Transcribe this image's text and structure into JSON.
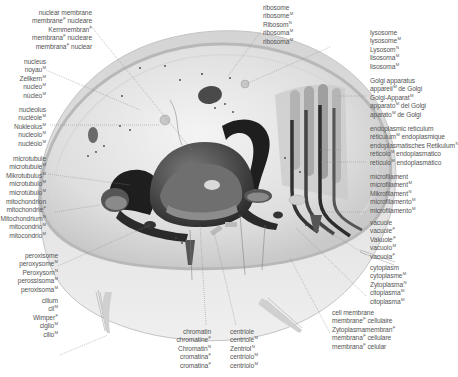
{
  "diagram": {
    "colors": {
      "label_text": "#555555",
      "leader_line": "#8a8a8a",
      "cell_fill": "#e6e6e6",
      "membrane": "#bdbdbd",
      "dark_organelle": "#2a2a2a"
    }
  },
  "labels": {
    "nuclear_membrane": {
      "lines": [
        {
          "t": "nuclear membrane",
          "g": ""
        },
        {
          "t": "membrane",
          "g": "F",
          "s": " nucleare"
        },
        {
          "t": "Kernmembran",
          "g": "F"
        },
        {
          "t": "membrana",
          "g": "F",
          "s": " nucleare"
        },
        {
          "t": "membrana",
          "g": "F",
          "s": " nuclear"
        }
      ]
    },
    "nucleus": {
      "lines": [
        {
          "t": "nucleus",
          "g": ""
        },
        {
          "t": "noyau",
          "g": "M"
        },
        {
          "t": "Zellkern",
          "g": "M"
        },
        {
          "t": "nucleo",
          "g": "M"
        },
        {
          "t": "núcleo",
          "g": "M"
        }
      ]
    },
    "nucleolus": {
      "lines": [
        {
          "t": "nucleolus",
          "g": ""
        },
        {
          "t": "nucléole",
          "g": "M"
        },
        {
          "t": "Nukleolus",
          "g": "M"
        },
        {
          "t": "nucleolo",
          "g": "M"
        },
        {
          "t": "nucléolo",
          "g": "M"
        }
      ]
    },
    "microtubule": {
      "lines": [
        {
          "t": "microtubule",
          "g": ""
        },
        {
          "t": "microtubule",
          "g": "M"
        },
        {
          "t": "Mikrotubulus",
          "g": "M"
        },
        {
          "t": "microtubulo",
          "g": "M"
        },
        {
          "t": "microtúbulo",
          "g": "M"
        }
      ]
    },
    "mitochondrion": {
      "lines": [
        {
          "t": "mitochondrion",
          "g": ""
        },
        {
          "t": "mitochondrie",
          "g": "F"
        },
        {
          "t": "Mitochondrium",
          "g": "N"
        },
        {
          "t": "mitocondrio",
          "g": "M"
        },
        {
          "t": "mitocondrio",
          "g": "M"
        }
      ]
    },
    "peroxisome": {
      "lines": [
        {
          "t": "peroxisome",
          "g": ""
        },
        {
          "t": "peroxysome",
          "g": "M"
        },
        {
          "t": "Peroxysom",
          "g": "N"
        },
        {
          "t": "perossisoma",
          "g": "M"
        },
        {
          "t": "peroxisoma",
          "g": "M"
        }
      ]
    },
    "cilium": {
      "lines": [
        {
          "t": "cilium",
          "g": ""
        },
        {
          "t": "cil",
          "g": "M"
        },
        {
          "t": "Wimper",
          "g": "F"
        },
        {
          "t": "ciglio",
          "g": "M"
        },
        {
          "t": "cilio",
          "g": "M"
        }
      ]
    },
    "ribosome": {
      "lines": [
        {
          "t": "ribosome",
          "g": ""
        },
        {
          "t": "ribosome",
          "g": "M"
        },
        {
          "t": "Ribosom",
          "g": "N"
        },
        {
          "t": "ribosoma",
          "g": "M"
        },
        {
          "t": "ribosoma",
          "g": "M"
        }
      ]
    },
    "lysosome": {
      "lines": [
        {
          "t": "lysosome",
          "g": ""
        },
        {
          "t": "lysosome",
          "g": "M"
        },
        {
          "t": "Lysosom",
          "g": "N"
        },
        {
          "t": "lisosoma",
          "g": "M"
        },
        {
          "t": "lisosoma",
          "g": "M"
        }
      ]
    },
    "golgi": {
      "lines": [
        {
          "t": "Golgi apparatus",
          "g": ""
        },
        {
          "t": "appareil",
          "g": "M",
          "s": " de Golgi"
        },
        {
          "t": "Golgi-Apparat",
          "g": "M"
        },
        {
          "t": "apparato",
          "g": "M",
          "s": " del Golgi"
        },
        {
          "t": "aparato",
          "g": "M",
          "s": " de Golgi"
        }
      ]
    },
    "endoplasmic_reticulum": {
      "lines": [
        {
          "t": "endoplasmic reticulum",
          "g": ""
        },
        {
          "t": "réticulum",
          "g": "M",
          "s": " endoplasmique"
        },
        {
          "t": "endoplasmatisches Retikulum",
          "g": "N"
        },
        {
          "t": "reticolo",
          "g": "M",
          "s": " endoplasmatico"
        },
        {
          "t": "retículo",
          "g": "M",
          "s": " endoplasmático"
        }
      ]
    },
    "microfilament": {
      "lines": [
        {
          "t": "microfilament",
          "g": ""
        },
        {
          "t": "microfilament",
          "g": "M"
        },
        {
          "t": "Mikrofilament",
          "g": "N"
        },
        {
          "t": "microfilamento",
          "g": "M"
        },
        {
          "t": "microfilamento",
          "g": "M"
        }
      ]
    },
    "vacuole": {
      "lines": [
        {
          "t": "vacuole",
          "g": ""
        },
        {
          "t": "vacuole",
          "g": "F"
        },
        {
          "t": "Vakuole",
          "g": "F"
        },
        {
          "t": "vacuolo",
          "g": "M"
        },
        {
          "t": "vacuola",
          "g": "F"
        }
      ]
    },
    "cytoplasm": {
      "lines": [
        {
          "t": "cytoplasm",
          "g": ""
        },
        {
          "t": "cytoplasme",
          "g": "M"
        },
        {
          "t": "Zytoplasma",
          "g": "N"
        },
        {
          "t": "citoplasma",
          "g": "M"
        },
        {
          "t": "citoplasma",
          "g": "M"
        }
      ]
    },
    "cell_membrane": {
      "lines": [
        {
          "t": "cell membrane",
          "g": ""
        },
        {
          "t": "membrane",
          "g": "F",
          "s": " cellulaire"
        },
        {
          "t": "Zytoplasmamembran",
          "g": "F"
        },
        {
          "t": "membrana",
          "g": "F",
          "s": " cellulare"
        },
        {
          "t": "membrana",
          "g": "F",
          "s": " celular"
        }
      ]
    },
    "chromatin": {
      "lines": [
        {
          "t": "chromatin",
          "g": ""
        },
        {
          "t": "chromatine",
          "g": "F"
        },
        {
          "t": "Chromatin",
          "g": "N"
        },
        {
          "t": "cromatina",
          "g": "F"
        },
        {
          "t": "cromatina",
          "g": "F"
        }
      ]
    },
    "centriole": {
      "lines": [
        {
          "t": "centriole",
          "g": ""
        },
        {
          "t": "centriole",
          "g": "M"
        },
        {
          "t": "Zentriol",
          "g": "N"
        },
        {
          "t": "centriolo",
          "g": "M"
        },
        {
          "t": "centriolo",
          "g": "M"
        }
      ]
    }
  }
}
